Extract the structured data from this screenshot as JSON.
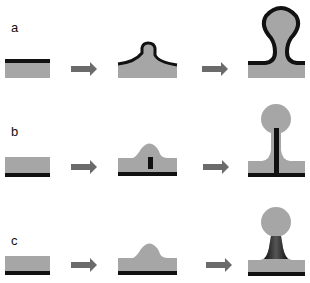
{
  "rows": [
    {
      "label": "a",
      "description": "coating layer on top of substrate deforms and wraps the outgrowth"
    },
    {
      "label": "b",
      "description": "black layer at bottom; inner rod grows upward through bulge"
    },
    {
      "label": "c",
      "description": "black layer at bottom; neck darkens as droplet pinches off"
    }
  ],
  "colors": {
    "substrate": "#a6a6a6",
    "layer": "#111111",
    "arrow": "#6b6b6b",
    "background": "#ffffff"
  }
}
